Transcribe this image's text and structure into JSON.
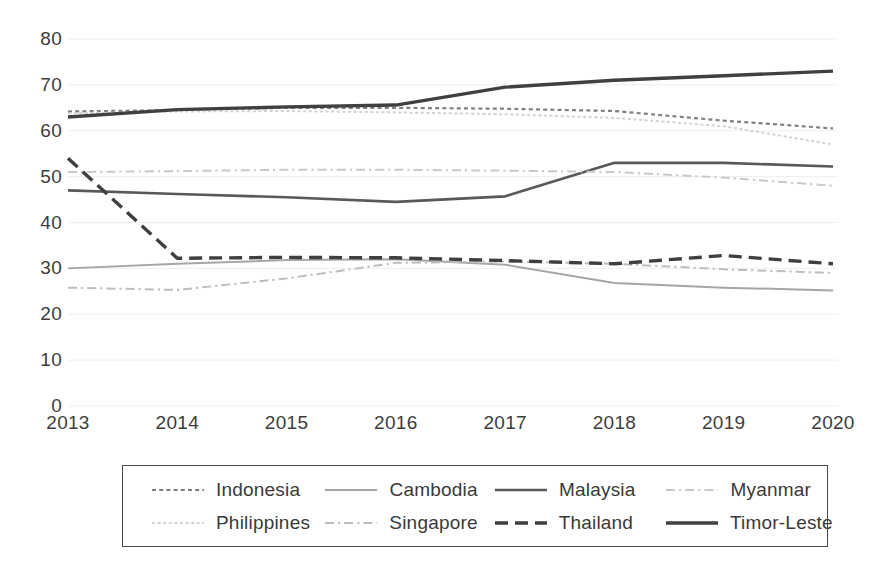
{
  "chart_data": {
    "type": "line",
    "title": "",
    "xlabel": "",
    "ylabel": "",
    "categories": [
      "2013",
      "2014",
      "2015",
      "2016",
      "2017",
      "2018",
      "2019",
      "2020"
    ],
    "x": [
      2013,
      2014,
      2015,
      2016,
      2017,
      2018,
      2019,
      2020
    ],
    "ylim": [
      0,
      80
    ],
    "yticks": [
      0,
      10,
      20,
      30,
      40,
      50,
      60,
      70,
      80
    ],
    "grid": true,
    "legend_position": "bottom",
    "series": [
      {
        "name": "Indonesia",
        "values": [
          64.2,
          64.5,
          65.0,
          65.0,
          64.8,
          64.3,
          62.2,
          60.5
        ],
        "style": "dotted",
        "color": "#7f7f7f",
        "width": 2.2
      },
      {
        "name": "Cambodia",
        "values": [
          30.0,
          31.0,
          31.8,
          32.0,
          30.8,
          26.8,
          25.8,
          25.2
        ],
        "style": "solid",
        "color": "#a6a6a6",
        "width": 2.0
      },
      {
        "name": "Malaysia",
        "values": [
          47.0,
          46.2,
          45.5,
          44.5,
          45.7,
          53.0,
          53.0,
          52.2
        ],
        "style": "solid",
        "color": "#595959",
        "width": 2.6
      },
      {
        "name": "Myanmar",
        "values": [
          51.0,
          51.2,
          51.5,
          51.5,
          51.3,
          51.0,
          49.8,
          48.0
        ],
        "style": "dashdot",
        "color": "#c9c9c9",
        "width": 2.0
      },
      {
        "name": "Philippines",
        "values": [
          63.8,
          64.2,
          64.3,
          64.0,
          63.6,
          62.8,
          61.0,
          57.0
        ],
        "style": "dotted-faint",
        "color": "#d2d2d2",
        "width": 2.0
      },
      {
        "name": "Singapore",
        "values": [
          25.8,
          25.3,
          27.8,
          31.2,
          31.5,
          31.0,
          29.8,
          29.0
        ],
        "style": "dashdot",
        "color": "#bdbdbd",
        "width": 2.0
      },
      {
        "name": "Thailand",
        "values": [
          54.0,
          32.2,
          32.4,
          32.3,
          31.7,
          31.0,
          32.8,
          31.0
        ],
        "style": "dashed",
        "color": "#3f3f3f",
        "width": 3.4
      },
      {
        "name": "Timor-Leste",
        "values": [
          63.0,
          64.6,
          65.2,
          65.6,
          69.5,
          71.0,
          72.0,
          73.0
        ],
        "style": "solid",
        "color": "#404040",
        "width": 3.4
      }
    ]
  },
  "axes": {
    "y_tick_labels": [
      "80",
      "70",
      "60",
      "50",
      "40",
      "30",
      "20",
      "10",
      "0"
    ],
    "x_tick_labels": [
      "2013",
      "2014",
      "2015",
      "2016",
      "2017",
      "2018",
      "2019",
      "2020"
    ]
  },
  "legend": {
    "rows": [
      [
        {
          "label": "Indonesia",
          "series": "Indonesia"
        },
        {
          "label": "Cambodia",
          "series": "Cambodia"
        },
        {
          "label": "Malaysia",
          "series": "Malaysia"
        },
        {
          "label": "Myanmar",
          "series": "Myanmar"
        }
      ],
      [
        {
          "label": "Philippines",
          "series": "Philippines"
        },
        {
          "label": "Singapore",
          "series": "Singapore"
        },
        {
          "label": "Thailand",
          "series": "Thailand"
        },
        {
          "label": "Timor-Leste",
          "series": "Timor-Leste"
        }
      ]
    ]
  },
  "colors": {
    "grid": "#eeeeee",
    "text": "#3d3d3d",
    "legend_border": "#4a4a4a",
    "background": "#ffffff"
  }
}
